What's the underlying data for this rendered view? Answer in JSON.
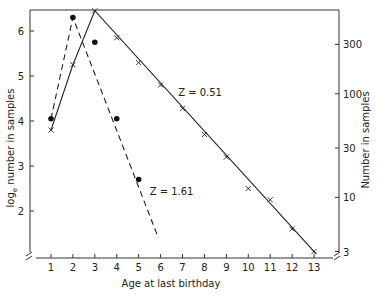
{
  "chart_data": {
    "type": "line",
    "title": "",
    "xlabel": "Age at last birthday",
    "ylabel": "log_e number in samples",
    "ylabel_main": "log",
    "ylabel_sub": "e",
    "ylabel_rest": " number in samples",
    "y2label": "Number in samples",
    "xlim": [
      0,
      14
    ],
    "ylim": [
      1.1,
      6.5
    ],
    "x_ticks": [
      1,
      2,
      3,
      4,
      5,
      6,
      7,
      8,
      9,
      10,
      11,
      12,
      13
    ],
    "y_ticks": [
      2,
      3,
      4,
      5,
      6
    ],
    "y2_ticks": [
      {
        "label": "300",
        "value": 300
      },
      {
        "label": "100",
        "value": 100
      },
      {
        "label": "30",
        "value": 30
      },
      {
        "label": "10",
        "value": 10
      },
      {
        "label": "3",
        "value": 3
      }
    ],
    "grid": false,
    "series": [
      {
        "name": "Z=0.51",
        "marker": "x",
        "line": "solid",
        "x": [
          1,
          2,
          3,
          4,
          5,
          6,
          7,
          8,
          9,
          10,
          11,
          12,
          13
        ],
        "values": [
          3.8,
          5.25,
          6.45,
          5.85,
          5.3,
          4.8,
          4.28,
          3.7,
          3.2,
          2.5,
          2.25,
          1.6,
          1.1
        ],
        "fit_line": [
          [
            1,
            3.8
          ],
          [
            2,
            5.25
          ],
          [
            3,
            6.45
          ],
          [
            13.1,
            1.05
          ]
        ]
      },
      {
        "name": "Z=1.61",
        "marker": "dot",
        "line": "dashed",
        "x": [
          1,
          2,
          3,
          4,
          5
        ],
        "values": [
          4.05,
          6.3,
          5.75,
          4.05,
          2.7
        ],
        "fit_line": [
          [
            1,
            4.05
          ],
          [
            2,
            6.3
          ],
          [
            5.9,
            1.4
          ]
        ]
      }
    ],
    "annotations": [
      {
        "text": "Z = 0.51",
        "x": 6.8,
        "y": 4.55
      },
      {
        "text": "Z = 1.61",
        "x": 5.5,
        "y": 2.35
      }
    ]
  }
}
